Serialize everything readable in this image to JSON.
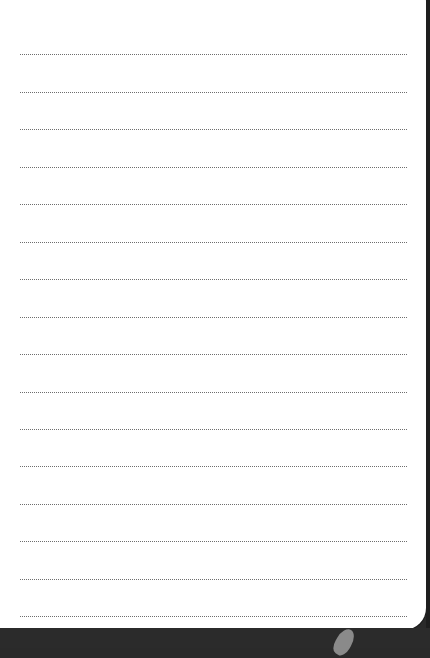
{
  "page": {
    "type": "lined notebook page",
    "background": "#ffffff",
    "line_color": "#6e6e6e",
    "line_style": "dotted",
    "line_count": 16,
    "line_positions_y": [
      54,
      92,
      129,
      167,
      204,
      242,
      279,
      317,
      354,
      392,
      429,
      466,
      504,
      541,
      579,
      616
    ]
  },
  "surroundings": {
    "background": "#2a2a2a"
  }
}
